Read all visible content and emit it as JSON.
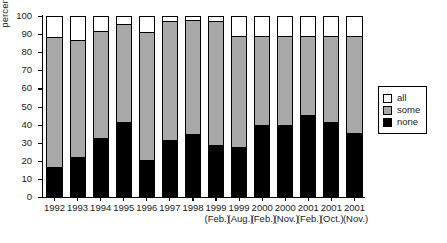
{
  "chart_data": {
    "type": "bar",
    "stacked": true,
    "title": "",
    "xlabel": "",
    "ylabel": "percentages",
    "ylim": [
      0,
      100
    ],
    "yticks": [
      0,
      10,
      20,
      30,
      40,
      50,
      60,
      70,
      80,
      90,
      100
    ],
    "grid": false,
    "legend_position": "right",
    "categories": [
      "1992",
      "1993",
      "1994",
      "1995",
      "1996",
      "1997",
      "1998",
      "1999 (Feb.)",
      "1999 (Aug.)",
      "2000 (Feb.)",
      "2000 (Nov.)",
      "2001 (Feb.)",
      "2001 (Oct.)",
      "2001 (Nov.)"
    ],
    "category_years": [
      "1992",
      "1993",
      "1994",
      "1995",
      "1996",
      "1997",
      "1998",
      "1999",
      "1999",
      "2000",
      "2000",
      "2001",
      "2001",
      "2001"
    ],
    "category_months": [
      "",
      "",
      "",
      "",
      "",
      "",
      "",
      "(Feb.)",
      "(Aug.)",
      "(Feb.)",
      "(Nov.)",
      "(Feb.)",
      "(Oct.)",
      "(Nov.)"
    ],
    "series": [
      {
        "name": "none",
        "color": "#000000",
        "values": [
          15.5,
          21.0,
          31.5,
          40.5,
          19.5,
          30.5,
          33.5,
          27.5,
          26.5,
          38.5,
          38.5,
          44.0,
          40.5,
          34.0
        ]
      },
      {
        "name": "some",
        "color": "#a8a8a8",
        "values": [
          72.5,
          65.0,
          59.5,
          54.5,
          71.0,
          66.0,
          64.0,
          69.0,
          62.0,
          50.0,
          50.0,
          44.5,
          48.0,
          54.5
        ]
      },
      {
        "name": "all",
        "color": "#ffffff",
        "values": [
          12.0,
          14.0,
          9.0,
          5.0,
          9.5,
          3.5,
          2.5,
          3.5,
          11.5,
          11.5,
          11.5,
          11.5,
          11.5,
          11.5
        ]
      }
    ],
    "cumulative_tops": {
      "none": [
        15.5,
        21.0,
        31.5,
        40.5,
        19.5,
        30.5,
        33.5,
        27.5,
        26.5,
        38.5,
        38.5,
        44.0,
        40.5,
        34.0
      ],
      "none_plus_some": [
        88.0,
        86.0,
        91.0,
        95.0,
        90.5,
        96.5,
        97.5,
        96.5,
        88.5,
        88.5,
        88.5,
        88.5,
        88.5,
        88.5
      ],
      "total": [
        100,
        100,
        100,
        100,
        100,
        100,
        100,
        100,
        100,
        100,
        100,
        100,
        100,
        100
      ]
    }
  },
  "legend": {
    "items": [
      {
        "label": "all",
        "swatch": "white-swatch"
      },
      {
        "label": "some",
        "swatch": "gray-swatch"
      },
      {
        "label": "none",
        "swatch": "black-swatch"
      }
    ]
  },
  "colors": {
    "none": "#000000",
    "some": "#a8a8a8",
    "all": "#ffffff",
    "axis": "#000000"
  }
}
